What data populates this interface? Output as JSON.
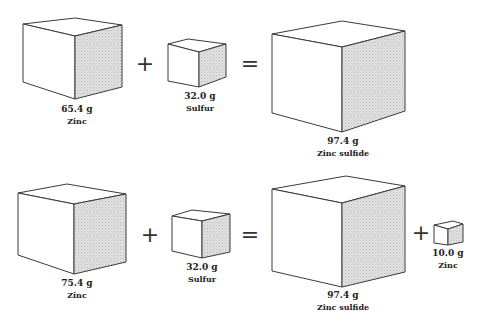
{
  "colors": {
    "line": "#3a3a3a",
    "shade": "#d6d6d6",
    "background": "#ffffff",
    "text": "#222222"
  },
  "rows": [
    {
      "name": "reaction-1",
      "cubes": [
        {
          "mass": "65.4 g",
          "label": "Zinc",
          "pts": {
            "A": [
              23,
              24
            ],
            "B": [
              75,
              18
            ],
            "C": [
              122,
              25
            ],
            "D": [
              75,
              36
            ],
            "E": [
              23,
              82
            ],
            "F": [
              75,
              99
            ],
            "G": [
              122,
              87
            ]
          },
          "text_x": 77,
          "mass_y": 112,
          "label_y": 124
        },
        {
          "mass": "32.0 g",
          "label": "Sulfur",
          "pts": {
            "A": [
              168,
              44
            ],
            "B": [
              188,
              39
            ],
            "C": [
              226,
              44
            ],
            "D": [
              199,
              52
            ],
            "E": [
              168,
              81
            ],
            "F": [
              199,
              87
            ],
            "G": [
              226,
              77
            ]
          },
          "text_x": 200,
          "mass_y": 99,
          "label_y": 111
        },
        {
          "mass": "97.4 g",
          "label": "Zinc sulfide",
          "pts": {
            "A": [
              272,
              34
            ],
            "B": [
              342,
              21
            ],
            "C": [
              405,
              31
            ],
            "D": [
              342,
              47
            ],
            "E": [
              272,
              113
            ],
            "F": [
              342,
              132
            ],
            "G": [
              405,
              111
            ]
          },
          "text_x": 343,
          "mass_y": 144,
          "label_y": 156
        }
      ],
      "operators": [
        {
          "symbol": "+",
          "x": 145,
          "y": 71
        },
        {
          "symbol": "=",
          "x": 250,
          "y": 71
        }
      ]
    },
    {
      "name": "reaction-2",
      "cubes": [
        {
          "mass": "75.4 g",
          "label": "Zinc",
          "pts": {
            "A": [
              18,
              193
            ],
            "B": [
              67,
              184
            ],
            "C": [
              126,
              194
            ],
            "D": [
              74,
              204
            ],
            "E": [
              18,
              255
            ],
            "F": [
              74,
              274
            ],
            "G": [
              126,
              262
            ]
          },
          "text_x": 77,
          "mass_y": 286,
          "label_y": 298
        },
        {
          "mass": "32.0 g",
          "label": "Sulfur",
          "pts": {
            "A": [
              172,
              216
            ],
            "B": [
              192,
              210
            ],
            "C": [
              230,
              214
            ],
            "D": [
              202,
              221
            ],
            "E": [
              172,
              251
            ],
            "F": [
              202,
              258
            ],
            "G": [
              230,
              252
            ]
          },
          "text_x": 202,
          "mass_y": 270,
          "label_y": 282
        },
        {
          "mass": "97.4 g",
          "label": "Zinc sulfide",
          "pts": {
            "A": [
              272,
              189
            ],
            "B": [
              346,
              176
            ],
            "C": [
              405,
              186
            ],
            "D": [
              342,
              203
            ],
            "E": [
              272,
              271
            ],
            "F": [
              342,
              287
            ],
            "G": [
              405,
              272
            ]
          },
          "text_x": 343,
          "mass_y": 298,
          "label_y": 310
        },
        {
          "mass": "10.0 g",
          "label": "Zinc",
          "pts": {
            "A": [
              434,
              225
            ],
            "B": [
              453,
              221
            ],
            "C": [
              463,
              224
            ],
            "D": [
              448,
              229
            ],
            "E": [
              434,
              243
            ],
            "F": [
              448,
              245
            ],
            "G": [
              463,
              242
            ]
          },
          "text_x": 448,
          "mass_y": 256,
          "label_y": 268
        }
      ],
      "operators": [
        {
          "symbol": "+",
          "x": 150,
          "y": 242
        },
        {
          "symbol": "=",
          "x": 250,
          "y": 242
        },
        {
          "symbol": "+",
          "x": 421,
          "y": 240
        }
      ]
    }
  ]
}
